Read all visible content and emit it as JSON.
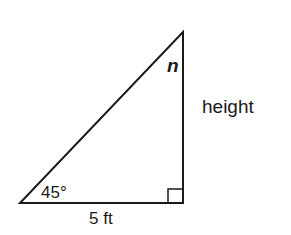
{
  "diagram": {
    "type": "right-triangle",
    "labels": {
      "top_angle": "n",
      "right_side": "height",
      "bottom_left_angle": "45°",
      "base": "5 ft"
    },
    "colors": {
      "stroke": "#1a1a1a",
      "background": "#ffffff"
    }
  }
}
